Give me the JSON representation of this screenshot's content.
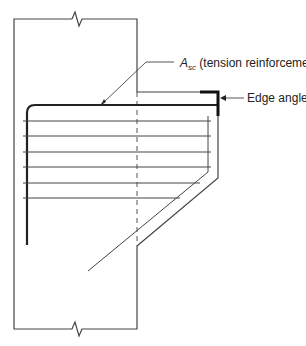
{
  "diagram": {
    "type": "corbel reinforcement detail",
    "labels": {
      "asc_symbol": "A",
      "asc_subscript": "sc",
      "asc_text": " (tension reinforcement)",
      "edge_angle": "Edge angle"
    },
    "colors": {
      "line": "#333333",
      "background": "#ffffff"
    }
  }
}
